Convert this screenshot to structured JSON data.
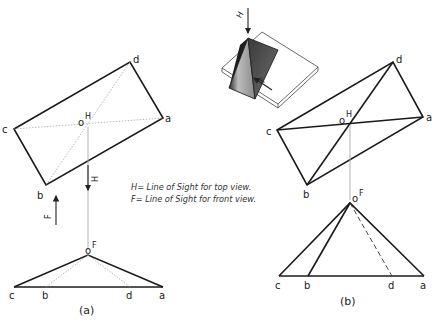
{
  "figure": {
    "legend": {
      "line1": "H= Line of Sight for top view.",
      "line2": "F= Line of Sight for front view."
    },
    "captions": {
      "a": "(a)",
      "b": "(b)"
    },
    "pictorial": {
      "arrow_h_label": "H",
      "arrow_f_label": "F"
    },
    "view_a": {
      "top_view": {
        "vertex_labels": {
          "c": "c",
          "d": "d",
          "a": "a",
          "b": "b"
        },
        "apex_label": "H",
        "apex_marker": "o"
      },
      "arrow_h_label": "H",
      "arrow_f_label": "F",
      "front_view": {
        "apex_label": "F",
        "apex_marker": "o",
        "base_labels": {
          "c": "c",
          "b": "b",
          "d": "d",
          "a": "a"
        }
      }
    },
    "view_b": {
      "top_view": {
        "vertex_labels": {
          "c": "c",
          "d": "d",
          "a": "a",
          "b": "b"
        },
        "apex_label": "H",
        "apex_marker": "o"
      },
      "front_view": {
        "apex_label": "F",
        "apex_marker": "o",
        "base_labels": {
          "c": "c",
          "b": "b",
          "d": "d",
          "a": "a"
        }
      }
    }
  }
}
